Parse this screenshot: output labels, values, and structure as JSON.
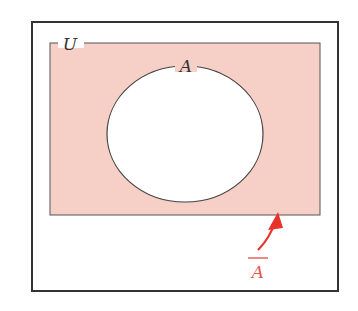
{
  "diagram": {
    "type": "venn",
    "universe_label": "U",
    "set_label": "A",
    "complement_label": "A",
    "complement_overline": true,
    "colors": {
      "shade": "#f6cfc6",
      "outline": "#333333",
      "accent": "#e8332b",
      "complement_text": "#e8554d"
    }
  }
}
